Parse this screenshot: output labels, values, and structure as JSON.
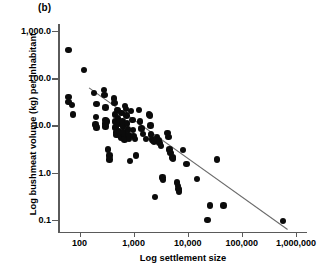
{
  "figure": {
    "panel_label": "(b)",
    "xlabel": "Log settlement size",
    "ylabel": "Log bushmeat volume (kg) per inhabitant",
    "point_color": "#0b0b0b",
    "axis_color": "#5a5a5a",
    "trendline_color": "#6b6b6b"
  },
  "chart_data": {
    "type": "scatter",
    "title": "(b)",
    "xlabel": "Log settlement size",
    "ylabel": "Log bushmeat volume (kg) per inhabitant",
    "xscale": "log",
    "yscale": "log",
    "xlim": [
      40,
      1600000
    ],
    "ylim": [
      0.055,
      1400
    ],
    "grid": false,
    "legend": null,
    "xticks": [
      100,
      1000,
      10000,
      100000,
      1000000
    ],
    "xticklabels": [
      "100",
      "1,000",
      "10,000",
      "100,000",
      "1,000,000"
    ],
    "yticks": [
      1000.0,
      100.0,
      10.0,
      1.0,
      0.1
    ],
    "yticklabels": [
      "1,000.0",
      "100.0",
      "10.0",
      "1.0",
      "0.1"
    ],
    "trendline": {
      "type": "linear-in-log-log",
      "x_start": 150,
      "y_start": 62,
      "x_end": 700000,
      "y_end": 0.062
    },
    "points": [
      [
        62,
        390
      ],
      [
        120,
        150
      ],
      [
        63,
        40
      ],
      [
        63,
        31
      ],
      [
        72,
        27
      ],
      [
        75,
        17
      ],
      [
        185,
        49
      ],
      [
        205,
        28
      ],
      [
        200,
        15
      ],
      [
        198,
        10.5
      ],
      [
        205,
        9.0
      ],
      [
        285,
        56
      ],
      [
        290,
        44
      ],
      [
        300,
        24
      ],
      [
        300,
        13
      ],
      [
        300,
        11
      ],
      [
        300,
        9.5
      ],
      [
        320,
        12
      ],
      [
        340,
        3.1
      ],
      [
        355,
        2.3
      ],
      [
        360,
        1.9
      ],
      [
        430,
        37
      ],
      [
        440,
        30
      ],
      [
        450,
        17
      ],
      [
        455,
        12
      ],
      [
        460,
        9.0
      ],
      [
        470,
        7.0
      ],
      [
        480,
        6.3
      ],
      [
        500,
        21
      ],
      [
        520,
        14
      ],
      [
        530,
        11
      ],
      [
        540,
        7.6
      ],
      [
        560,
        6.0
      ],
      [
        580,
        5.4
      ],
      [
        600,
        18
      ],
      [
        620,
        12
      ],
      [
        640,
        9.5
      ],
      [
        650,
        7.0
      ],
      [
        660,
        5.6
      ],
      [
        680,
        5.0
      ],
      [
        700,
        26
      ],
      [
        720,
        22
      ],
      [
        740,
        16
      ],
      [
        760,
        11
      ],
      [
        780,
        8.2
      ],
      [
        800,
        6.2
      ],
      [
        820,
        5.2
      ],
      [
        850,
        1.75
      ],
      [
        900,
        20
      ],
      [
        950,
        13
      ],
      [
        980,
        8.0
      ],
      [
        1000,
        6.0
      ],
      [
        1050,
        5.2
      ],
      [
        1100,
        2.3
      ],
      [
        1250,
        21
      ],
      [
        1300,
        12
      ],
      [
        1400,
        8.5
      ],
      [
        1500,
        6.5
      ],
      [
        1700,
        5.2
      ],
      [
        1900,
        17
      ],
      [
        2000,
        16
      ],
      [
        2050,
        10
      ],
      [
        2100,
        6.4
      ],
      [
        2200,
        5.0
      ],
      [
        2300,
        4.6
      ],
      [
        2400,
        4.4
      ],
      [
        2500,
        0.3
      ],
      [
        2700,
        5.6
      ],
      [
        2900,
        4.8
      ],
      [
        3000,
        4.2
      ],
      [
        3200,
        3.6
      ],
      [
        3400,
        0.78
      ],
      [
        3500,
        0.7
      ],
      [
        4200,
        6.8
      ],
      [
        4400,
        5.6
      ],
      [
        4600,
        3.1
      ],
      [
        4800,
        2.6
      ],
      [
        5200,
        2.1
      ],
      [
        5400,
        2.0
      ],
      [
        6400,
        0.62
      ],
      [
        6600,
        0.52
      ],
      [
        6800,
        0.45
      ],
      [
        6900,
        0.4
      ],
      [
        8200,
        3.0
      ],
      [
        9500,
        1.5
      ],
      [
        15000,
        0.74
      ],
      [
        23000,
        0.098
      ],
      [
        26000,
        0.2
      ],
      [
        35000,
        1.9
      ],
      [
        46000,
        0.2
      ],
      [
        570000,
        0.095
      ]
    ]
  }
}
